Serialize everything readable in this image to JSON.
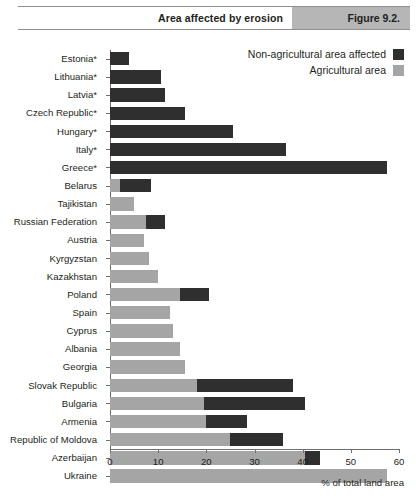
{
  "header": {
    "title": "Area affected by erosion",
    "figure_number": "Figure 9.2."
  },
  "legend": {
    "items": [
      {
        "label": "Non-agricultural area affected",
        "color": "#2f2f2f",
        "swatch": "dark-swatch"
      },
      {
        "label": "Agricultural area",
        "color": "#a5a5a5",
        "swatch": "light-swatch"
      }
    ]
  },
  "axis": {
    "x_title": "% of total land area",
    "x_ticks": [
      0,
      10,
      20,
      30,
      40,
      50,
      60
    ],
    "x_min": 0,
    "x_max": 60
  },
  "chart_data": {
    "type": "bar",
    "orientation": "horizontal",
    "stacked": true,
    "title": "Area affected by erosion",
    "xlabel": "% of total land area",
    "ylabel": "",
    "xlim": [
      0,
      60
    ],
    "grid": false,
    "legend_position": "top-right",
    "categories": [
      "Estonia*",
      "Lithuania*",
      "Latvia*",
      "Czech Republic*",
      "Hungary*",
      "Italy*",
      "Greece*",
      "Belarus",
      "Tajikistan",
      "Russian Federation",
      "Austria",
      "Kyrgyzstan",
      "Kazakhstan",
      "Poland",
      "Spain",
      "Cyprus",
      "Albania",
      "Georgia",
      "Slovak Republic",
      "Bulgaria",
      "Armenia",
      "Republic of Moldova",
      "Azerbaijan",
      "Ukraine"
    ],
    "series": [
      {
        "name": "Agricultural area",
        "color": "#a5a5a5",
        "values": [
          0,
          0,
          0,
          0,
          0,
          0,
          0,
          2.0,
          5.0,
          7.5,
          7.0,
          8.0,
          10.0,
          14.5,
          12.5,
          13.0,
          14.5,
          15.5,
          18.0,
          19.5,
          20.0,
          25.0,
          40.5,
          57.5
        ]
      },
      {
        "name": "Non-agricultural area affected",
        "color": "#2f2f2f",
        "values": [
          4.0,
          10.5,
          11.5,
          15.5,
          25.5,
          36.5,
          57.5,
          6.5,
          0,
          4.0,
          0,
          0,
          0,
          6.0,
          0,
          0,
          0,
          0,
          20.0,
          21.0,
          8.5,
          11.0,
          3.0,
          0
        ]
      }
    ]
  }
}
